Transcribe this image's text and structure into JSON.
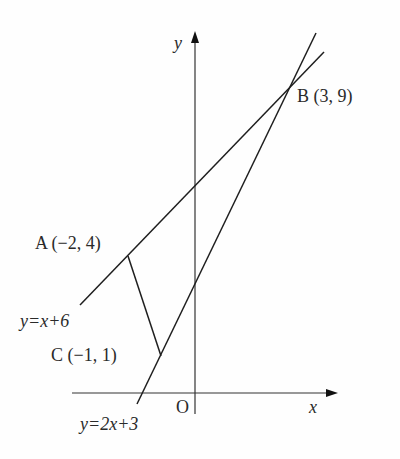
{
  "diagram": {
    "type": "coordinate-geometry",
    "axes": {
      "x_label": "x",
      "y_label": "y",
      "origin_label": "O"
    },
    "points": [
      {
        "name": "A",
        "label": "A (−2, 4)",
        "x": -2,
        "y": 4
      },
      {
        "name": "B",
        "label": "B (3, 9)",
        "x": 3,
        "y": 9
      },
      {
        "name": "C",
        "label": "C (−1, 1)",
        "x": -1,
        "y": 1
      }
    ],
    "lines": [
      {
        "equation": "y=x+6",
        "label": "y=x+6"
      },
      {
        "equation": "y=2x+3",
        "label": "y=2x+3"
      }
    ],
    "segments": [
      {
        "from": "A",
        "to": "C"
      }
    ],
    "colors": {
      "line": "#1e1e1e",
      "axis": "#333333",
      "background": "#fefefe"
    }
  }
}
